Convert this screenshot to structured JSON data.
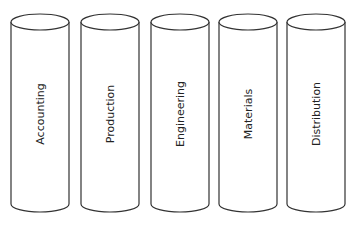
{
  "diagram": {
    "type": "silos",
    "stroke_color": "#333333",
    "fill_color": "#ffffff",
    "cylinders": [
      {
        "label": "Accounting",
        "cx": 40
      },
      {
        "label": "Production",
        "cx": 110
      },
      {
        "label": "Engineering",
        "cx": 180
      },
      {
        "label": "Materials",
        "cx": 248
      },
      {
        "label": "Distribution",
        "cx": 316
      }
    ]
  }
}
